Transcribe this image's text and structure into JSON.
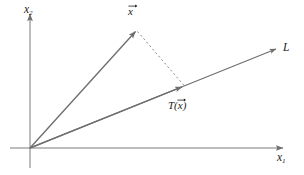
{
  "figure": {
    "width": 304,
    "height": 175,
    "background": "#ffffff",
    "ink_color": "#6e6e6e",
    "label_color": "#1a1a1a"
  },
  "axes": {
    "origin": {
      "x": 30,
      "y": 148
    },
    "x_axis": {
      "label_base": "x",
      "label_sub": "1",
      "start": {
        "x": 10,
        "y": 148
      },
      "end": {
        "x": 285,
        "y": 148
      },
      "arrow": true
    },
    "y_axis": {
      "label_base": "x",
      "label_sub": "2",
      "start": {
        "x": 30,
        "y": 168
      },
      "end": {
        "x": 30,
        "y": 12
      },
      "arrow": true
    }
  },
  "line": {
    "name": "L",
    "label": "L",
    "from": {
      "x": 30,
      "y": 148
    },
    "to": {
      "x": 278,
      "y": 48
    },
    "arrow": true
  },
  "vectors": [
    {
      "name": "x-vector",
      "label_base": "x",
      "label_accent": "arrow",
      "from": {
        "x": 30,
        "y": 148
      },
      "to": {
        "x": 137,
        "y": 30
      },
      "arrow": true,
      "style": "solid"
    },
    {
      "name": "projection-vector",
      "label_base": "T(x)",
      "label_accent": "arrow",
      "label_prefix": "T(",
      "label_suffix": ")",
      "label_inner": "x",
      "from": {
        "x": 30,
        "y": 148
      },
      "to": {
        "x": 184,
        "y": 86
      },
      "arrow": true,
      "style": "solid"
    }
  ],
  "projection_segment": {
    "name": "dashed-projection",
    "from": {
      "x": 137,
      "y": 30
    },
    "to": {
      "x": 184,
      "y": 86
    },
    "style": "dashed",
    "dash_pattern": "2,2.6"
  },
  "labels": {
    "x_axis": "x",
    "x_axis_sub": "1",
    "y_axis": "x",
    "y_axis_sub": "2",
    "line": "L",
    "vector": "x",
    "projection_prefix": "T(",
    "projection_inner": "x",
    "projection_suffix": ")"
  }
}
